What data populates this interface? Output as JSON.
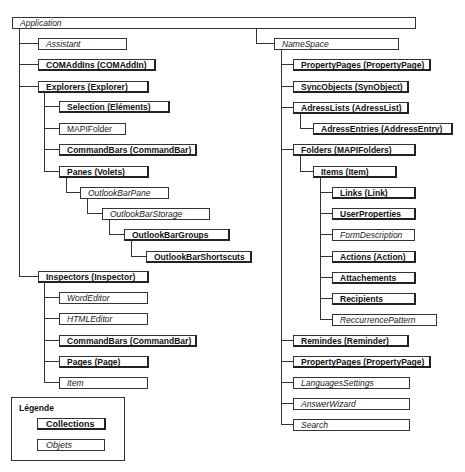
{
  "diagram": {
    "root": {
      "label": "Application",
      "type": "object"
    },
    "left_branch": [
      {
        "label": "Assistant",
        "type": "object"
      },
      {
        "label": "COMAddIns (COMAddIn)",
        "type": "collection"
      },
      {
        "label": "Explorers (Explorer)",
        "type": "collection",
        "children": [
          {
            "label": "Selection (Eléments)",
            "type": "collection"
          },
          {
            "label": "MAPIFolder",
            "type": "plain"
          },
          {
            "label": "CommandBars (CommandBar)",
            "type": "collection"
          },
          {
            "label": "Panes (Volets)",
            "type": "collection",
            "children": [
              {
                "label": "OutlookBarPane",
                "type": "object",
                "children": [
                  {
                    "label": "OutlookBarStorage",
                    "type": "object",
                    "children": [
                      {
                        "label": "OutlookBarGroups",
                        "type": "collection",
                        "children": [
                          {
                            "label": "OutlookBarShortscuts",
                            "type": "collection"
                          }
                        ]
                      }
                    ]
                  }
                ]
              }
            ]
          }
        ]
      },
      {
        "label": "Inspectors (Inspector)",
        "type": "collection",
        "children": [
          {
            "label": "WordEditor",
            "type": "object"
          },
          {
            "label": "HTMLEditor",
            "type": "object"
          },
          {
            "label": "CommandBars (CommandBar)",
            "type": "collection"
          },
          {
            "label": "Pages (Page)",
            "type": "collection"
          },
          {
            "label": "Item",
            "type": "object"
          }
        ]
      }
    ],
    "namespace": {
      "label": "NameSpace",
      "type": "object",
      "children": [
        {
          "label": "PropertyPages (PropertyPage)",
          "type": "collection"
        },
        {
          "label": "SyncObjects (SynObject)",
          "type": "collection"
        },
        {
          "label": "AdressLists (AdressList)",
          "type": "collection",
          "children": [
            {
              "label": "AdressEntries (AddressEntry)",
              "type": "collection"
            }
          ]
        },
        {
          "label": "Folders (MAPIFolders)",
          "type": "collection",
          "children": [
            {
              "label": "Items (Item)",
              "type": "collection",
              "children": [
                {
                  "label": "Links (Link)",
                  "type": "collection"
                },
                {
                  "label": "UserProperties",
                  "type": "collection"
                },
                {
                  "label": "FormDescription",
                  "type": "object"
                },
                {
                  "label": "Actions (Action)",
                  "type": "collection"
                },
                {
                  "label": "Attachements",
                  "type": "collection"
                },
                {
                  "label": "Recipients",
                  "type": "collection"
                },
                {
                  "label": "ReccurrencePattern",
                  "type": "object"
                }
              ]
            }
          ]
        },
        {
          "label": "Remindes (Reminder)",
          "type": "collection"
        },
        {
          "label": "PropertyPages (PropertyPage)",
          "type": "collection"
        },
        {
          "label": "LanguagesSettings",
          "type": "object"
        },
        {
          "label": "AnswerWizard",
          "type": "object"
        },
        {
          "label": "Search",
          "type": "object"
        }
      ]
    },
    "legend": {
      "title": "Légende",
      "collections": "Collections",
      "objects": "Objets"
    }
  }
}
